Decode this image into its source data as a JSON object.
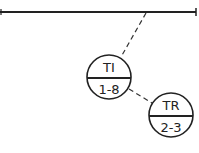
{
  "diagram": {
    "type": "instrumentation-diagram",
    "process_line": {
      "x1": 0,
      "y1": 12,
      "x2": 196,
      "y2": 12
    },
    "instruments": [
      {
        "id": "ti",
        "function": "TI",
        "loop": "1-8",
        "cx": 109,
        "cy": 77,
        "r": 22
      },
      {
        "id": "tr",
        "function": "TR",
        "loop": "2-3",
        "cx": 171,
        "cy": 115,
        "r": 22
      }
    ],
    "signal_lines": [
      {
        "from": "process-line",
        "to": "TI",
        "x1": 146,
        "y1": 13,
        "x2": 121,
        "y2": 57
      },
      {
        "from": "TI",
        "to": "TR",
        "x1": 129,
        "y1": 89,
        "x2": 152,
        "y2": 103
      }
    ],
    "colors": {
      "line": "#222222",
      "background": "#ffffff"
    }
  }
}
